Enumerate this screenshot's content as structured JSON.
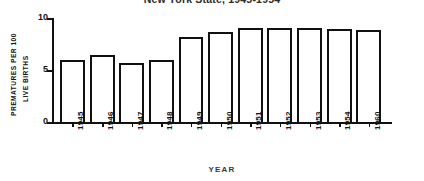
{
  "chart_data": {
    "type": "bar",
    "title": "New York State, 1945-1954",
    "xlabel": "YEAR",
    "ylabel": "PREMATURES PER 100 LIVE BIRTHS",
    "ylabel_line1": "PREMATURES PER 100",
    "ylabel_line2": "LIVE BIRTHS",
    "categories": [
      "1945",
      "1946",
      "1947",
      "1948",
      "1949",
      "1950",
      "1951",
      "1952",
      "1953",
      "1954",
      "1960"
    ],
    "values": [
      6.2,
      6.7,
      5.9,
      6.2,
      8.5,
      9.0,
      9.4,
      9.4,
      9.4,
      9.3,
      9.2
    ],
    "ylim": [
      0,
      10.4
    ],
    "yticks": [
      0,
      5,
      10
    ],
    "ytick_labels": [
      "0",
      "5",
      "10"
    ],
    "grid": false,
    "legend": "none",
    "bar_style": "outline",
    "colors": {
      "bar_outline": "#111111",
      "bar_fill": "#ffffff",
      "axis": "#111111",
      "text": "#141414",
      "background": "#ffffff"
    }
  }
}
